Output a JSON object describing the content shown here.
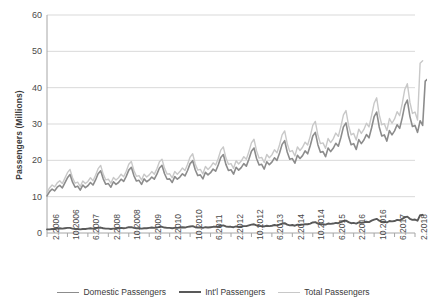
{
  "chart_data": {
    "type": "line",
    "title": "",
    "xlabel": "",
    "ylabel": "Passengers (Millions)",
    "ylim": [
      0,
      60
    ],
    "yticks": [
      0,
      10,
      20,
      30,
      40,
      50,
      60
    ],
    "grid": true,
    "legend_position": "bottom",
    "x_tick_labels": [
      "2.2006",
      "10.2006",
      "6.2007",
      "2.2008",
      "10.2008",
      "6.2009",
      "2.2010",
      "10.2010",
      "6.2011",
      "2.2012",
      "10.2012",
      "6.2013",
      "2.2014",
      "10.2014",
      "6.2015",
      "2.2016",
      "10.2016",
      "6.2017",
      "2.2018"
    ],
    "x_tick_step_months": 8,
    "x_start": "2.2006",
    "x_end": "2.2018",
    "x_count": 145,
    "series": [
      {
        "name": "Domestic Passengers",
        "color": "#8c8c8c",
        "values": [
          10.2,
          11.4,
          12.1,
          11.6,
          12.6,
          13.1,
          12.4,
          13.8,
          15.2,
          16.1,
          14.0,
          12.6,
          12.9,
          11.8,
          13.2,
          12.5,
          13.0,
          13.9,
          13.2,
          14.6,
          16.3,
          17.1,
          14.9,
          13.4,
          13.6,
          12.6,
          14.1,
          13.4,
          13.9,
          14.8,
          14.2,
          15.6,
          17.3,
          18.1,
          15.8,
          14.3,
          14.5,
          13.4,
          14.9,
          14.1,
          14.6,
          15.4,
          14.8,
          16.2,
          17.9,
          18.6,
          16.3,
          14.8,
          14.9,
          13.9,
          15.5,
          14.8,
          15.4,
          16.3,
          15.7,
          17.2,
          19.1,
          19.9,
          17.4,
          15.8,
          16.0,
          14.9,
          16.7,
          16.0,
          16.6,
          17.6,
          17.0,
          18.7,
          20.8,
          21.6,
          18.9,
          17.2,
          17.4,
          16.2,
          18.1,
          17.3,
          18.0,
          19.1,
          18.4,
          20.3,
          22.5,
          23.4,
          20.5,
          18.7,
          18.9,
          17.6,
          19.6,
          18.8,
          19.5,
          20.7,
          20.0,
          22.0,
          24.4,
          25.4,
          22.3,
          20.3,
          20.5,
          19.2,
          21.4,
          20.5,
          21.3,
          22.6,
          21.8,
          24.0,
          26.7,
          27.7,
          24.3,
          22.2,
          22.4,
          21.0,
          23.4,
          22.4,
          23.3,
          24.7,
          23.9,
          26.3,
          29.2,
          30.3,
          26.6,
          24.3,
          24.6,
          23.0,
          25.7,
          24.6,
          25.6,
          27.1,
          26.2,
          28.9,
          32.0,
          33.3,
          29.2,
          26.7,
          27.0,
          25.3,
          28.2,
          27.0,
          28.1,
          29.8,
          28.8,
          31.7,
          35.2,
          36.6,
          32.1,
          29.3,
          29.6,
          27.7,
          30.9,
          29.6,
          41.8,
          42.4
        ],
        "end_value": 42
      },
      {
        "name": "Int'l Passengers",
        "color": "#595959",
        "values": [
          1.0,
          1.0,
          1.1,
          1.1,
          1.2,
          1.3,
          1.2,
          1.3,
          1.4,
          1.4,
          1.2,
          1.1,
          1.1,
          1.0,
          1.1,
          1.1,
          1.2,
          1.3,
          1.2,
          1.3,
          1.4,
          1.5,
          1.3,
          1.2,
          1.2,
          1.1,
          1.2,
          1.2,
          1.3,
          1.4,
          1.3,
          1.4,
          1.6,
          1.6,
          1.4,
          1.3,
          1.3,
          1.2,
          1.3,
          1.3,
          1.4,
          1.5,
          1.4,
          1.5,
          1.7,
          1.7,
          1.5,
          1.4,
          1.4,
          1.3,
          1.4,
          1.4,
          1.5,
          1.6,
          1.5,
          1.7,
          1.8,
          1.9,
          1.6,
          1.5,
          1.5,
          1.4,
          1.6,
          1.5,
          1.6,
          1.7,
          1.7,
          1.8,
          2.0,
          2.1,
          1.8,
          1.7,
          1.7,
          1.6,
          1.8,
          1.7,
          1.8,
          1.9,
          1.9,
          2.1,
          2.3,
          2.4,
          2.1,
          1.9,
          1.9,
          1.8,
          2.0,
          1.9,
          2.0,
          2.2,
          2.1,
          2.3,
          2.6,
          2.7,
          2.3,
          2.1,
          2.2,
          2.0,
          2.3,
          2.2,
          2.3,
          2.4,
          2.4,
          2.6,
          2.9,
          3.0,
          2.6,
          2.4,
          2.4,
          2.3,
          2.6,
          2.5,
          2.6,
          2.8,
          2.7,
          3.0,
          3.3,
          3.4,
          3.0,
          2.7,
          2.8,
          2.6,
          2.9,
          2.8,
          2.9,
          3.1,
          3.0,
          3.4,
          3.7,
          3.9,
          3.4,
          3.1,
          3.1,
          2.9,
          3.3,
          3.2,
          3.3,
          3.6,
          3.5,
          3.9,
          4.3,
          4.5,
          3.9,
          3.6,
          3.7,
          3.4,
          4.9,
          5.0
        ],
        "end_value": 5
      },
      {
        "name": "Total Passengers",
        "color": "#c8c8c8",
        "values": [
          11.2,
          12.4,
          13.2,
          12.7,
          13.8,
          14.4,
          13.6,
          15.1,
          16.6,
          17.5,
          15.2,
          13.7,
          14.0,
          12.8,
          14.3,
          13.6,
          14.2,
          15.2,
          14.4,
          15.9,
          17.7,
          18.6,
          16.2,
          14.6,
          14.8,
          13.7,
          15.3,
          14.6,
          15.2,
          16.2,
          15.5,
          17.0,
          18.9,
          19.7,
          17.2,
          15.6,
          15.8,
          14.6,
          16.2,
          15.4,
          16.0,
          16.9,
          16.2,
          17.7,
          19.6,
          20.3,
          17.8,
          16.2,
          16.3,
          15.2,
          16.9,
          16.2,
          16.9,
          17.9,
          17.2,
          18.9,
          20.9,
          21.8,
          19.0,
          17.3,
          17.5,
          16.3,
          18.3,
          17.5,
          18.2,
          19.3,
          18.7,
          20.5,
          22.8,
          23.7,
          20.7,
          18.9,
          19.1,
          17.8,
          19.9,
          19.0,
          19.8,
          21.0,
          20.3,
          22.4,
          24.8,
          25.8,
          22.6,
          20.6,
          20.8,
          19.4,
          21.6,
          20.7,
          21.5,
          22.9,
          22.1,
          24.3,
          27.0,
          28.1,
          24.6,
          22.4,
          22.7,
          21.2,
          23.7,
          22.7,
          23.6,
          25.0,
          24.2,
          26.6,
          29.6,
          30.7,
          26.9,
          24.6,
          24.8,
          23.3,
          26.0,
          24.9,
          25.9,
          27.5,
          26.6,
          29.3,
          32.5,
          33.7,
          29.6,
          27.0,
          27.4,
          25.6,
          28.6,
          27.4,
          28.5,
          30.2,
          29.2,
          32.3,
          35.7,
          37.2,
          32.6,
          29.8,
          30.1,
          28.2,
          31.5,
          30.2,
          31.4,
          33.4,
          32.3,
          35.6,
          39.5,
          41.1,
          36.0,
          32.9,
          33.3,
          31.1,
          46.7,
          47.4
        ],
        "end_value": 48
      }
    ]
  },
  "legend": {
    "items": [
      {
        "label": "Domestic Passengers",
        "color": "#8c8c8c",
        "width": 1.6
      },
      {
        "label": "Int'l Passengers",
        "color": "#595959",
        "width": 2.0
      },
      {
        "label": "Total Passengers",
        "color": "#c8c8c8",
        "width": 1.4
      }
    ]
  },
  "axes": {
    "y_title": "Passengers (Millions)",
    "y_ticks": [
      "0",
      "10",
      "20",
      "30",
      "40",
      "50",
      "60"
    ],
    "grid_color": "#d9d9d9",
    "axis_color": "#a6a6a6"
  }
}
